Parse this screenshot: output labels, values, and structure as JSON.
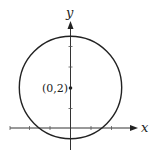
{
  "diagram": {
    "type": "circle-on-axes",
    "axes": {
      "x_label": "x",
      "y_label": "y"
    },
    "center_label": "(0,2)",
    "circle": {
      "center": [
        0,
        2
      ],
      "radius": 2.5
    },
    "colors": {
      "stroke": "#222222",
      "background": "#ffffff"
    }
  }
}
